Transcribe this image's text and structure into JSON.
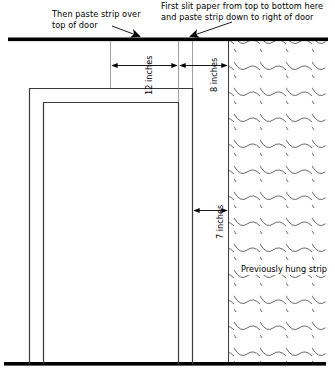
{
  "diagram": {
    "colors": {
      "ink": "#000000",
      "line": "#3a3a3a",
      "hatch": "#555555",
      "background": "#ffffff"
    },
    "callouts": [
      {
        "id": "callout-left",
        "name": "then-paste-strip-callout",
        "line1": "Then paste strip over",
        "line2": "top of door",
        "text": "Then paste strip over\ntop of door"
      },
      {
        "id": "callout-right",
        "name": "first-slit-paper-callout",
        "line1": "First slit paper from top to bottom here",
        "line2": "and paste strip down to right of door",
        "text": "First slit paper from top to bottom here\nand paste strip down to right of door"
      }
    ],
    "dimensions": [
      {
        "id": "dim-12",
        "name": "dimension-12-inches",
        "value": 12,
        "unit": "inches",
        "label": "12 inches",
        "orientation": "horizontal-measure",
        "rotated": true
      },
      {
        "id": "dim-8",
        "name": "dimension-8-inches",
        "value": 8,
        "unit": "inches",
        "label": "8 inches",
        "orientation": "horizontal-measure",
        "rotated": true
      },
      {
        "id": "dim-7",
        "name": "dimension-7-inches",
        "value": 7,
        "unit": "inches",
        "label": "7 inches",
        "orientation": "horizontal-measure",
        "rotated": true
      }
    ],
    "regions": [
      {
        "id": "hatch-region",
        "name": "previously-hung-strip-region",
        "label": "Previously hung strip",
        "line1": "Previously",
        "line2": "hung strip",
        "pattern": "wavy-diagonal-hatch"
      },
      {
        "id": "door-frame-outer",
        "name": "door-frame-outer-outline",
        "label": "Door frame (outer casing)"
      },
      {
        "id": "door-frame-inner",
        "name": "door-opening-inner-outline",
        "label": "Door opening (inner)"
      },
      {
        "id": "ceiling-bar",
        "name": "ceiling-line",
        "label": "Ceiling line"
      },
      {
        "id": "floor-bar",
        "name": "floor-line",
        "label": "Floor line"
      }
    ]
  }
}
